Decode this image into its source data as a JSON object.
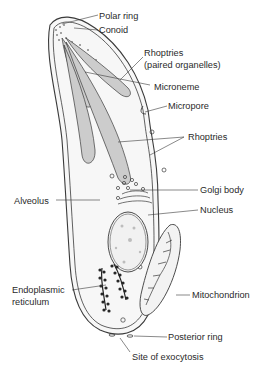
{
  "diagram": {
    "colors": {
      "outline": "#3a3a3a",
      "fill": "#f6f6f6",
      "organelle_fill": "#c9c9c9",
      "label": "#2a2a2a"
    },
    "labels": {
      "polar_ring": "Polar ring",
      "conoid": "Conoid",
      "rhoptries_paired_1": "Rhoptries",
      "rhoptries_paired_2": "(paired organelles)",
      "microneme": "Microneme",
      "micropore": "Micropore",
      "rhoptries": "Rhoptries",
      "golgi_body": "Golgi body",
      "alveolus": "Alveolus",
      "nucleus": "Nucleus",
      "endoplasmic_reticulum_1": "Endoplasmic",
      "endoplasmic_reticulum_2": "reticulum",
      "mitochondrion": "Mitochondrion",
      "posterior_ring": "Posterior ring",
      "site_of_exocytosis": "Site of exocytosis"
    }
  }
}
